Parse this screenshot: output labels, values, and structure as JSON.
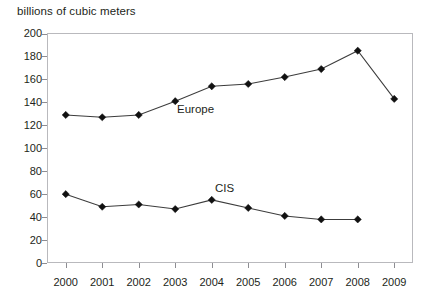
{
  "chart_data": {
    "type": "line",
    "title": "billions of cubic meters",
    "xlabel": "",
    "ylabel": "billions of cubic meters",
    "categories": [
      "2000",
      "2001",
      "2002",
      "2003",
      "2004",
      "2005",
      "2006",
      "2007",
      "2008",
      "2009"
    ],
    "x": [
      2000,
      2001,
      2002,
      2003,
      2004,
      2005,
      2006,
      2007,
      2008,
      2009
    ],
    "ylim": [
      0,
      200
    ],
    "y_ticks": [
      0,
      20,
      40,
      60,
      80,
      100,
      120,
      140,
      160,
      180,
      200
    ],
    "y_tick_labels": [
      "0",
      "20",
      "40",
      "60",
      "80",
      "100",
      "120",
      "140",
      "160",
      "180",
      "200"
    ],
    "grid": false,
    "legend_position": "inline-annotations",
    "series": [
      {
        "name": "Europe",
        "values": [
          129,
          127,
          129,
          141,
          154,
          156,
          162,
          169,
          185,
          143
        ],
        "marker": "diamond",
        "color": "#111111"
      },
      {
        "name": "CIS",
        "values": [
          60,
          49,
          51,
          47,
          55,
          48,
          41,
          38,
          38,
          null
        ],
        "marker": "diamond",
        "color": "#111111"
      }
    ],
    "annotations": [
      {
        "text": "Europe",
        "series": "Europe"
      },
      {
        "text": "CIS",
        "series": "CIS"
      }
    ]
  },
  "colors": {
    "marker": "#111111",
    "line": "#3c3c3c",
    "frame": "#b9b9bd",
    "tick": "#8d8d92",
    "text": "#231f20",
    "background": "#ffffff"
  }
}
